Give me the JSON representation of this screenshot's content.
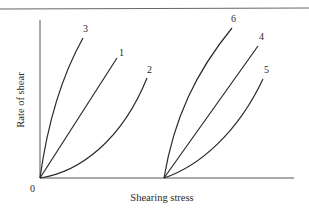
{
  "diagram": {
    "type": "rheology flow curves",
    "axes": {
      "xlabel": "Shearing stress",
      "ylabel": "Rate of shear",
      "origin_label": "0"
    },
    "groups": [
      {
        "name": "without yield stress (from origin)",
        "curves": [
          {
            "label": "3",
            "shape": "concave down"
          },
          {
            "label": "1",
            "shape": "linear"
          },
          {
            "label": "2",
            "shape": "concave up"
          }
        ]
      },
      {
        "name": "with yield stress (offset origin)",
        "curves": [
          {
            "label": "6",
            "shape": "concave down"
          },
          {
            "label": "4",
            "shape": "linear"
          },
          {
            "label": "5",
            "shape": "concave up"
          }
        ]
      }
    ]
  },
  "colors": {
    "line": "#2a2a2a",
    "axis": "#555555",
    "background": "#ffffff"
  }
}
